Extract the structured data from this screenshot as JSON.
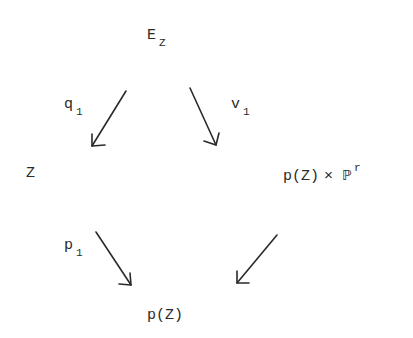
{
  "diagram": {
    "type": "commutative-diagram",
    "nodes": {
      "top": {
        "base": "E",
        "subscript": "Z"
      },
      "left": {
        "text": "Z"
      },
      "right": {
        "prefix": "p(Z)",
        "times": "×",
        "space": "ℙ",
        "superscript": "r"
      },
      "bottom": {
        "text": "p(Z)"
      }
    },
    "arrows": {
      "q": {
        "base": "q",
        "subscript": "1",
        "from": "E_Z",
        "to": "Z"
      },
      "v": {
        "base": "v",
        "subscript": "1",
        "from": "E_Z",
        "to": "p(Z) × ℙ^r"
      },
      "p": {
        "base": "p",
        "subscript": "1",
        "from": "Z",
        "to": "p(Z)"
      },
      "proj": {
        "from": "p(Z) × ℙ^r",
        "to": "p(Z)"
      }
    }
  }
}
